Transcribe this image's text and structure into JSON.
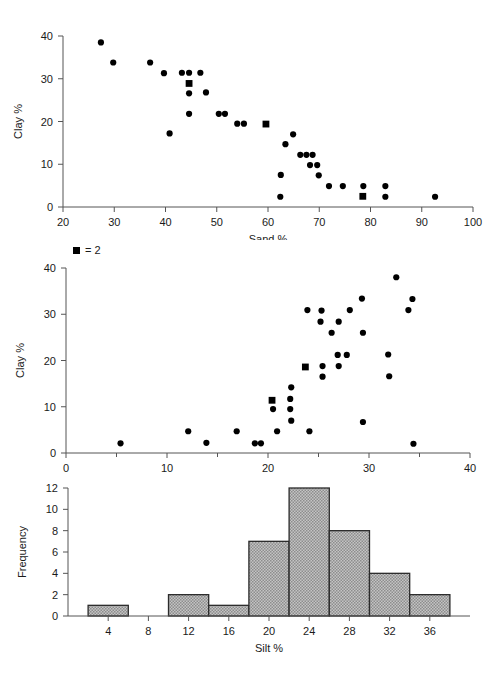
{
  "figure": {
    "background": "#ffffff",
    "marker_color": "#000000",
    "axis_color": "#555555",
    "bar_fill": "#a9a9a9",
    "bar_edge": "#2b2b2b"
  },
  "panels": {
    "top": {
      "name": "clay-vs-sand-scatter",
      "legend": null,
      "axis": {
        "xlabel": "Sand %",
        "ylabel": "Clay %",
        "xticks": [
          "20",
          "30",
          "40",
          "50",
          "60",
          "70",
          "80",
          "90",
          "100"
        ],
        "yticks": [
          "0",
          "10",
          "20",
          "30",
          "40"
        ]
      }
    },
    "middle": {
      "name": "clay-vs-silt-scatter",
      "legend": {
        "symbol": "■",
        "text": "= 2"
      },
      "axis": {
        "xlabel": "Silt %",
        "ylabel": "Clay %",
        "xticks": [
          "0",
          "10",
          "20",
          "30",
          "40"
        ],
        "yticks": [
          "0",
          "10",
          "20",
          "30",
          "40"
        ]
      }
    },
    "bottom": {
      "name": "silt-frequency-histogram",
      "axis": {
        "xlabel": "Silt %",
        "ylabel": "Frequency",
        "xticks": [
          "4",
          "8",
          "12",
          "16",
          "20",
          "24",
          "28",
          "32",
          "36"
        ],
        "yticks": [
          "0",
          "2",
          "4",
          "6",
          "8",
          "10",
          "12"
        ]
      }
    }
  },
  "chart_data": [
    {
      "type": "scatter",
      "name": "clay-vs-sand",
      "title": "",
      "xlabel": "Sand %",
      "ylabel": "Clay %",
      "xlim": [
        20,
        100
      ],
      "ylim": [
        0,
        40
      ],
      "xticks": [
        20,
        30,
        40,
        50,
        60,
        70,
        80,
        90,
        100
      ],
      "yticks": [
        0,
        10,
        20,
        30,
        40
      ],
      "grid": false,
      "legend": "square marker = 2 overlapping observations",
      "points": [
        {
          "x": 27.4,
          "y": 38.5,
          "n": 1
        },
        {
          "x": 29.8,
          "y": 33.8,
          "n": 1
        },
        {
          "x": 37.0,
          "y": 33.8,
          "n": 1
        },
        {
          "x": 39.7,
          "y": 31.3,
          "n": 1
        },
        {
          "x": 43.2,
          "y": 31.4,
          "n": 1
        },
        {
          "x": 44.6,
          "y": 31.4,
          "n": 1
        },
        {
          "x": 46.8,
          "y": 31.4,
          "n": 1
        },
        {
          "x": 44.6,
          "y": 28.9,
          "n": 2
        },
        {
          "x": 44.6,
          "y": 26.6,
          "n": 1
        },
        {
          "x": 47.9,
          "y": 26.8,
          "n": 1
        },
        {
          "x": 44.6,
          "y": 21.8,
          "n": 1
        },
        {
          "x": 50.4,
          "y": 21.8,
          "n": 1
        },
        {
          "x": 51.6,
          "y": 21.8,
          "n": 1
        },
        {
          "x": 40.8,
          "y": 17.2,
          "n": 1
        },
        {
          "x": 54.0,
          "y": 19.5,
          "n": 1
        },
        {
          "x": 55.3,
          "y": 19.5,
          "n": 1
        },
        {
          "x": 59.6,
          "y": 19.4,
          "n": 2
        },
        {
          "x": 64.9,
          "y": 17.0,
          "n": 1
        },
        {
          "x": 63.4,
          "y": 14.7,
          "n": 1
        },
        {
          "x": 66.3,
          "y": 12.2,
          "n": 1
        },
        {
          "x": 67.5,
          "y": 12.2,
          "n": 1
        },
        {
          "x": 68.7,
          "y": 12.2,
          "n": 1
        },
        {
          "x": 68.2,
          "y": 9.8,
          "n": 1
        },
        {
          "x": 69.6,
          "y": 9.8,
          "n": 1
        },
        {
          "x": 62.5,
          "y": 7.5,
          "n": 1
        },
        {
          "x": 69.9,
          "y": 7.4,
          "n": 1
        },
        {
          "x": 62.4,
          "y": 2.4,
          "n": 1
        },
        {
          "x": 71.9,
          "y": 4.9,
          "n": 1
        },
        {
          "x": 74.6,
          "y": 4.9,
          "n": 1
        },
        {
          "x": 78.6,
          "y": 4.9,
          "n": 1
        },
        {
          "x": 82.9,
          "y": 4.9,
          "n": 1
        },
        {
          "x": 78.5,
          "y": 2.5,
          "n": 2
        },
        {
          "x": 82.9,
          "y": 2.4,
          "n": 1
        },
        {
          "x": 92.6,
          "y": 2.4,
          "n": 1
        }
      ]
    },
    {
      "type": "scatter",
      "name": "clay-vs-silt",
      "title": "",
      "xlabel": "Silt %",
      "ylabel": "Clay %",
      "xlim": [
        0,
        40
      ],
      "ylim": [
        0,
        40
      ],
      "xticks": [
        0,
        10,
        20,
        30,
        40
      ],
      "yticks": [
        0,
        10,
        20,
        30,
        40
      ],
      "grid": false,
      "legend": "square marker = 2 overlapping observations",
      "points": [
        {
          "x": 5.4,
          "y": 2.1,
          "n": 1
        },
        {
          "x": 12.1,
          "y": 4.7,
          "n": 1
        },
        {
          "x": 13.9,
          "y": 2.2,
          "n": 1
        },
        {
          "x": 16.9,
          "y": 4.7,
          "n": 1
        },
        {
          "x": 18.7,
          "y": 2.1,
          "n": 1
        },
        {
          "x": 19.3,
          "y": 2.1,
          "n": 1
        },
        {
          "x": 20.4,
          "y": 11.4,
          "n": 2
        },
        {
          "x": 20.5,
          "y": 9.5,
          "n": 1
        },
        {
          "x": 20.9,
          "y": 4.7,
          "n": 1
        },
        {
          "x": 22.3,
          "y": 14.2,
          "n": 1
        },
        {
          "x": 22.2,
          "y": 11.7,
          "n": 1
        },
        {
          "x": 22.2,
          "y": 9.5,
          "n": 1
        },
        {
          "x": 22.3,
          "y": 7.0,
          "n": 1
        },
        {
          "x": 23.7,
          "y": 18.6,
          "n": 2
        },
        {
          "x": 23.9,
          "y": 30.9,
          "n": 1
        },
        {
          "x": 24.1,
          "y": 4.7,
          "n": 1
        },
        {
          "x": 25.3,
          "y": 30.8,
          "n": 1
        },
        {
          "x": 25.2,
          "y": 28.4,
          "n": 1
        },
        {
          "x": 25.4,
          "y": 18.8,
          "n": 1
        },
        {
          "x": 25.4,
          "y": 16.5,
          "n": 1
        },
        {
          "x": 26.3,
          "y": 26.0,
          "n": 1
        },
        {
          "x": 27.0,
          "y": 28.4,
          "n": 1
        },
        {
          "x": 26.9,
          "y": 21.2,
          "n": 1
        },
        {
          "x": 27.0,
          "y": 18.8,
          "n": 1
        },
        {
          "x": 27.8,
          "y": 21.2,
          "n": 1
        },
        {
          "x": 28.1,
          "y": 30.9,
          "n": 1
        },
        {
          "x": 29.3,
          "y": 33.4,
          "n": 1
        },
        {
          "x": 29.4,
          "y": 26.0,
          "n": 1
        },
        {
          "x": 29.4,
          "y": 6.7,
          "n": 1
        },
        {
          "x": 31.9,
          "y": 21.3,
          "n": 1
        },
        {
          "x": 32.0,
          "y": 16.6,
          "n": 1
        },
        {
          "x": 32.7,
          "y": 38.0,
          "n": 1
        },
        {
          "x": 33.9,
          "y": 30.9,
          "n": 1
        },
        {
          "x": 34.3,
          "y": 33.3,
          "n": 1
        },
        {
          "x": 34.4,
          "y": 2.0,
          "n": 1
        }
      ]
    },
    {
      "type": "bar",
      "name": "silt-histogram",
      "title": "",
      "xlabel": "Silt %",
      "ylabel": "Frequency",
      "xlim": [
        0,
        40
      ],
      "ylim": [
        0,
        12
      ],
      "xticks": [
        4,
        8,
        12,
        16,
        20,
        24,
        28,
        32,
        36
      ],
      "yticks": [
        0,
        2,
        4,
        6,
        8,
        10,
        12
      ],
      "grid": false,
      "bin_width": 4,
      "bins": [
        {
          "start": 2,
          "end": 6,
          "value": 1
        },
        {
          "start": 6,
          "end": 10,
          "value": 0
        },
        {
          "start": 10,
          "end": 14,
          "value": 2
        },
        {
          "start": 14,
          "end": 18,
          "value": 1
        },
        {
          "start": 18,
          "end": 22,
          "value": 7
        },
        {
          "start": 22,
          "end": 26,
          "value": 12
        },
        {
          "start": 26,
          "end": 30,
          "value": 8
        },
        {
          "start": 30,
          "end": 34,
          "value": 4
        },
        {
          "start": 34,
          "end": 38,
          "value": 2
        }
      ],
      "categories": [
        "2-6",
        "6-10",
        "10-14",
        "14-18",
        "18-22",
        "22-26",
        "26-30",
        "30-34",
        "34-38"
      ],
      "values": [
        1,
        0,
        2,
        1,
        7,
        12,
        8,
        4,
        2
      ]
    }
  ]
}
